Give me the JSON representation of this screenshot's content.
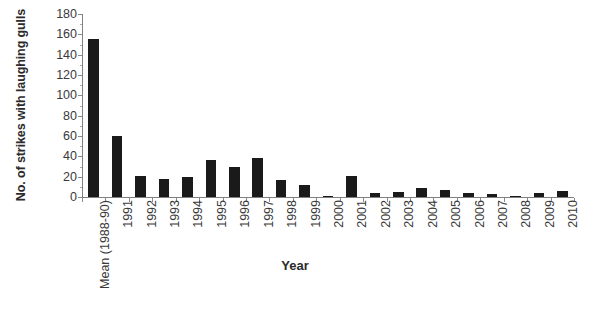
{
  "chart_data": {
    "type": "bar",
    "title": "",
    "xlabel": "Year",
    "ylabel": "No. of strikes with laughing gulls",
    "categories": [
      "Mean (1988-90)",
      "1991",
      "1992",
      "1993",
      "1994",
      "1995",
      "1996",
      "1997",
      "1998",
      "1999",
      "2000",
      "2001",
      "2002",
      "2003",
      "2004",
      "2005",
      "2006",
      "2007",
      "2008",
      "2009",
      "2010"
    ],
    "values": [
      155,
      60,
      21,
      18,
      20,
      36,
      30,
      38,
      17,
      12,
      1,
      21,
      4,
      5,
      9,
      7,
      4,
      3,
      1,
      4,
      6
    ],
    "ylim": [
      0,
      180
    ],
    "ytick_step": 20,
    "ytick_labels": [
      "0",
      "20",
      "40",
      "60",
      "80",
      "100",
      "120",
      "140",
      "160",
      "180"
    ],
    "grid": false,
    "legend": false,
    "bar_color": "#1a1a1a",
    "axis_color": "#808080",
    "text_color": "#3a3a3a"
  }
}
